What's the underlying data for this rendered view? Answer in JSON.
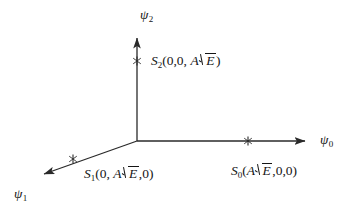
{
  "figure": {
    "background_color": "#ffffff",
    "line_color": "#2a2a2a",
    "text_color": "#141414"
  },
  "axes": [
    {
      "id": "psi0",
      "symbol": "ψ",
      "subscript": "0",
      "direction": "right",
      "origin": {
        "x": 137,
        "y": 141
      },
      "tip": {
        "x": 313,
        "y": 141
      },
      "label_position": {
        "x": 320,
        "y": 134
      }
    },
    {
      "id": "psi1",
      "symbol": "ψ",
      "subscript": "1",
      "direction": "down-left",
      "origin": {
        "x": 137,
        "y": 141
      },
      "tip": {
        "x": 35,
        "y": 177
      },
      "label_position": {
        "x": 14,
        "y": 187
      }
    },
    {
      "id": "psi2",
      "symbol": "ψ",
      "subscript": "2",
      "direction": "up",
      "origin": {
        "x": 137,
        "y": 141
      },
      "tip": {
        "x": 137,
        "y": 29
      },
      "label_position": {
        "x": 140,
        "y": 8
      }
    }
  ],
  "points": [
    {
      "id": "S0",
      "symbol": "S",
      "subscript": "0",
      "coordinates": [
        "A√E",
        "0",
        "0"
      ],
      "coord_text_prefix": "(",
      "coord_amplitude": "A",
      "coord_energy": "E",
      "coord_suffix": ",0,0)",
      "marker": {
        "x": 248,
        "y": 141
      },
      "label_position": {
        "x": 231,
        "y": 162
      }
    },
    {
      "id": "S1",
      "symbol": "S",
      "subscript": "1",
      "coordinates": [
        "0",
        "A√E",
        "0"
      ],
      "coord_text_prefix": "(0, ",
      "coord_amplitude": "A",
      "coord_energy": "E",
      "coord_suffix": ",0)",
      "marker": {
        "x": 73,
        "y": 159
      },
      "label_position": {
        "x": 84,
        "y": 165
      }
    },
    {
      "id": "S2",
      "symbol": "S",
      "subscript": "2",
      "coordinates": [
        "0",
        "0",
        "A√E"
      ],
      "coord_text_prefix": "(0,0, ",
      "coord_amplitude": "A",
      "coord_energy": "E",
      "coord_suffix": ")",
      "marker": {
        "x": 137,
        "y": 61
      },
      "label_position": {
        "x": 151,
        "y": 52
      }
    }
  ]
}
